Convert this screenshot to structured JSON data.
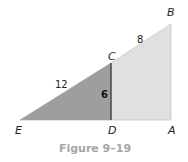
{
  "figure": {
    "caption": "Figure 9–19",
    "vertices": {
      "E": {
        "label": "E",
        "x": 20,
        "y": 120
      },
      "D": {
        "label": "D",
        "x": 111,
        "y": 120
      },
      "A": {
        "label": "A",
        "x": 171,
        "y": 120
      },
      "C": {
        "label": "C",
        "x": 111,
        "y": 63
      },
      "B": {
        "label": "B",
        "x": 171,
        "y": 24
      }
    },
    "segment_labels": {
      "EC": "12",
      "CB": "8",
      "CD": "6"
    },
    "colors": {
      "small_triangle": "#9e9e9e",
      "trapezoid": "#e0e0e0",
      "segment_cd": "#333333",
      "outline": "#bdbdbd",
      "caption": "#a6a6a6"
    }
  }
}
